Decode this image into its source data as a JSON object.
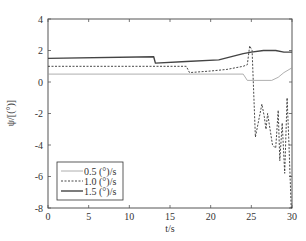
{
  "chart_data": {
    "type": "line",
    "title": "",
    "xlabel": "t/s",
    "ylabel": "ψ/[(°)]",
    "xlim": [
      0,
      30
    ],
    "ylim": [
      -8,
      4
    ],
    "xticks": [
      0,
      5,
      10,
      15,
      20,
      25,
      30
    ],
    "yticks": [
      -8,
      -6,
      -4,
      -2,
      0,
      2,
      4
    ],
    "grid": false,
    "legend_position": "lower left",
    "series": [
      {
        "name": "0.5 (°)/s",
        "style": "solid-thin",
        "color": "#9a9a9a",
        "x": [
          0,
          24.0,
          24.5,
          27.5,
          28.3,
          29.0,
          30
        ],
        "y": [
          0.5,
          0.5,
          0.1,
          0.1,
          0.3,
          0.6,
          0.9
        ]
      },
      {
        "name": "1.0 (°)/s",
        "style": "dashed",
        "color": "#333333",
        "x": [
          0,
          17.0,
          17.4,
          20.0,
          22.0,
          24.0,
          24.5,
          24.8,
          25.1,
          25.5,
          26.3,
          26.6,
          26.8,
          27.0,
          27.6,
          28.0,
          28.3,
          28.5,
          28.8,
          29.1,
          29.4,
          29.6,
          29.9,
          30
        ],
        "y": [
          1.0,
          1.0,
          0.6,
          0.7,
          0.8,
          1.0,
          1.1,
          2.3,
          2.0,
          -3.5,
          -1.4,
          -2.2,
          -3.0,
          -2.0,
          -4.0,
          -4.2,
          -1.8,
          -5.0,
          -2.6,
          -5.8,
          -1.0,
          -3.5,
          -8.0,
          -8.0
        ]
      },
      {
        "name": "1.5 (°)/s",
        "style": "solid-thick",
        "color": "#444444",
        "x": [
          0,
          13.0,
          13.2,
          17.0,
          21.0,
          24.0,
          25.0,
          26.5,
          28.0,
          29.0,
          30
        ],
        "y": [
          1.5,
          1.6,
          1.2,
          1.3,
          1.4,
          1.8,
          1.9,
          2.0,
          2.0,
          1.9,
          1.9
        ]
      }
    ]
  },
  "legend": {
    "items": [
      "0.5 (°)/s",
      "1.0 (°)/s",
      "1.5 (°)/s"
    ]
  }
}
